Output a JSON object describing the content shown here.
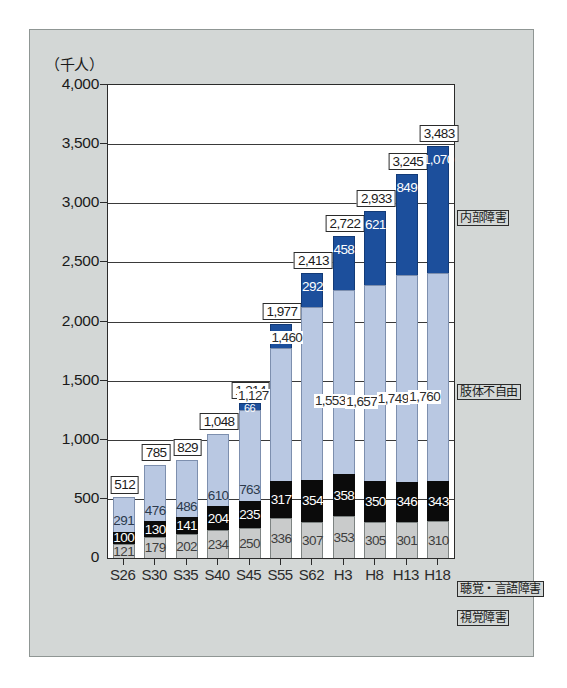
{
  "chart_data": {
    "type": "bar",
    "subtype": "stacked-vertical",
    "title": "",
    "unit_label": "（千人）",
    "xlabel": "",
    "ylabel": "",
    "ylim": [
      0,
      4000
    ],
    "ytick_labels": [
      "0",
      "500",
      "1,000",
      "1,500",
      "2,000",
      "2,500",
      "3,000",
      "3,500",
      "4,000"
    ],
    "ytick_values": [
      0,
      500,
      1000,
      1500,
      2000,
      2500,
      3000,
      3500,
      4000
    ],
    "grid": true,
    "legend_position": "right",
    "categories": [
      "S26",
      "S30",
      "S35",
      "S40",
      "S45",
      "S55",
      "S62",
      "H3",
      "H8",
      "H13",
      "H18"
    ],
    "series": [
      {
        "name": "視覚障害",
        "color": "#c9cbcb",
        "values": [
          121,
          179,
          202,
          234,
          250,
          336,
          307,
          353,
          305,
          301,
          310
        ],
        "labels": [
          "121",
          "179",
          "202",
          "234",
          "250",
          "336",
          "307",
          "353",
          "305",
          "301",
          "310"
        ]
      },
      {
        "name": "聴覚・言語障害",
        "color": "#0b0b0b",
        "values": [
          100,
          130,
          141,
          204,
          235,
          317,
          354,
          358,
          350,
          346,
          343
        ],
        "labels": [
          "100",
          "130",
          "141",
          "204",
          "235",
          "317",
          "354",
          "358",
          "350",
          "346",
          "343"
        ]
      },
      {
        "name": "肢体不自由",
        "color": "#b9c8e2",
        "values": [
          291,
          476,
          486,
          610,
          763,
          1127,
          1460,
          1553,
          1657,
          1749,
          1760
        ],
        "labels": [
          "291",
          "476",
          "486",
          "610",
          "763",
          "1,127",
          "1,460",
          "1,553",
          "1,657",
          "1,749",
          "1,760"
        ]
      },
      {
        "name": "内部障害",
        "color": "#1c4f9c",
        "values": [
          0,
          0,
          0,
          0,
          66,
          197,
          292,
          458,
          621,
          849,
          1070
        ],
        "labels": [
          "",
          "",
          "",
          "",
          "66",
          "197",
          "292",
          "458",
          "621",
          "849",
          "1,070"
        ]
      }
    ],
    "totals": [
      512,
      785,
      829,
      1048,
      1314,
      1977,
      2413,
      2722,
      2933,
      3245,
      3483
    ],
    "total_labels": [
      "512",
      "785",
      "829",
      "1,048",
      "1,314",
      "1,977",
      "2,413",
      "2,722",
      "2,933",
      "3,245",
      "3,483"
    ]
  },
  "legend": {
    "items": [
      {
        "label": "内部障害",
        "top": 180
      },
      {
        "label": "肢体不自由",
        "top": 354
      },
      {
        "label": "聴覚・言語障害",
        "top": 551
      },
      {
        "label": "視覚障害",
        "top": 580
      }
    ]
  }
}
